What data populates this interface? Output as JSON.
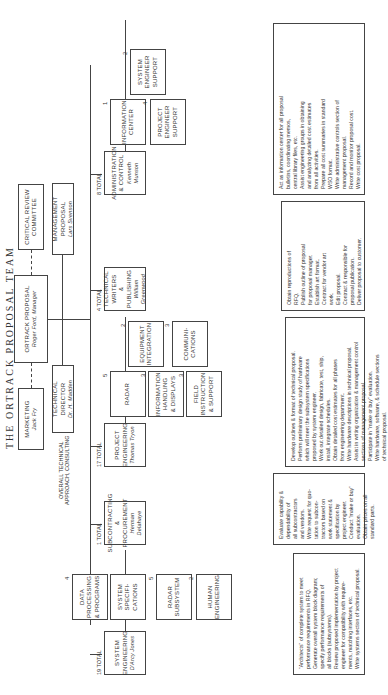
{
  "title": "The Ortrack Proposal Team",
  "top": {
    "marketing": {
      "title": "Marketing",
      "name": "Jack Fry"
    },
    "ortrack": {
      "title": "Ortrack Proposal",
      "name": "Roger Ford, Manager"
    },
    "critical_review": {
      "title": "Critical Review",
      "name": "Committee"
    },
    "technical_director": {
      "title": "Technical Director",
      "name": "Dr. H. Madden"
    },
    "management_proposal": {
      "title": "Management Proposal",
      "name": "Lars Svenson"
    },
    "consulting_note": [
      "Overall Technical",
      "Approach, Consulting"
    ]
  },
  "groups": [
    {
      "id": "system-engineering",
      "total": "19 Total",
      "title": [
        "System",
        "Engineering"
      ],
      "name": "D'Arcy Jones",
      "subs": [
        {
          "label": [
            "System",
            "Specifi-",
            "cations"
          ],
          "count": "7"
        },
        {
          "label": [
            "Data",
            "Processing",
            "& Programs"
          ],
          "count": "4"
        },
        {
          "label": [
            "Radar",
            "Subsystem"
          ],
          "count": "5"
        },
        {
          "label": [
            "Human",
            "Engineering"
          ],
          "count": "2"
        }
      ],
      "duties": [
        "\"Architects\" of complete system to meet",
        "performance requirements in RFQ.",
        "Generate overall system block diagram;",
        "specify performance requirements of",
        "all blocks (subsystems).",
        "Review proposed implementation by project",
        "engineer for compatibility with require-",
        "ments, matching interfaces, etc.",
        "Write systems section of technical proposal."
      ]
    },
    {
      "id": "subcontracting",
      "total": "1 Total",
      "title": [
        "Subcontracting",
        "& Procurement"
      ],
      "name": "Herman Delahaye",
      "subs": [],
      "duties": [
        "Evaluate capability &",
        "dependability of",
        "all subcontractors",
        "and vendors.",
        "Write request for quo-",
        "tation to subcon-",
        "tractors based on",
        "work statement &",
        "specification by",
        "project engineer.",
        "Conduct \"make or buy\"",
        "evaluation.",
        "Obtain prices on all",
        "standard parts."
      ]
    },
    {
      "id": "project-engineering",
      "total": "17 Total",
      "title": [
        "Project",
        "Engineering"
      ],
      "name": "Thomas Tryon",
      "subs": [
        {
          "label": [
            "Radar"
          ],
          "count": "5"
        },
        {
          "label": [
            "Information",
            "Handling",
            "& Displays"
          ],
          "count": "3"
        },
        {
          "label": [
            "Field",
            "Instruction",
            "& Support"
          ],
          "count": "3"
        },
        {
          "label": [
            "Equipment",
            "Integration"
          ],
          "count": "2"
        },
        {
          "label": [
            "Communi-",
            "cations"
          ],
          "count": "3"
        }
      ],
      "duties": [
        "Develop outlines & format of technical proposal.",
        "Perform preliminary design study of hardware",
        "which will meet the subsystem specifications",
        "proposed by system engineer.",
        "Work out detailed design, fabricate, test, ship,",
        "install, integrate schedules.",
        "Obtain detailed cost estimates for all phases",
        "from engineering department.",
        "Write hardware descriptions in technical proposal.",
        "Assist in writing organization & management control",
        "sections of management proposal.",
        "Participate in \"make or buy\" evaluation.",
        "Write hardware, software, & schedule sections",
        "of technical proposal."
      ]
    },
    {
      "id": "technical-writers",
      "total": "4 Total",
      "title": [
        "Technical Writers",
        "& Publishing"
      ],
      "name": "William Greenwood",
      "subs": [],
      "duties": [
        "Obtain reproductions of",
        "RFQ.",
        "Publish outline of proposal",
        "for proposal manager.",
        "Establish art format.",
        "Contract for vendor art",
        "work.",
        "Edit proposal.",
        "Contract & responsible for",
        "proposal publication.",
        "Deliver proposal to customer."
      ]
    },
    {
      "id": "administration",
      "total": "8 Total",
      "title": [
        "Administration",
        "& Control"
      ],
      "name": "Kenneth Munson",
      "subs": [
        {
          "label": [
            "Information",
            "Center"
          ],
          "count": "1"
        },
        {
          "label": [
            "Project",
            "Engineer",
            "Support"
          ],
          "count": "4"
        },
        {
          "label": [
            "System",
            "Engineer",
            "Support"
          ],
          "count": "2"
        }
      ],
      "duties": [
        "Act as information center for all proposal",
        "bulletins, coordinating memos,",
        "central library files, etc.",
        "Assist engineering groups in obtaining",
        "and analyzing detailed cost estimates",
        "from all activities.",
        "Prepare all cost summaries in standard",
        "WSO format.",
        "Write administrative controls section of",
        "management proposal.",
        "Record and monitor proposal cost.",
        "Write cost proposal."
      ]
    }
  ]
}
